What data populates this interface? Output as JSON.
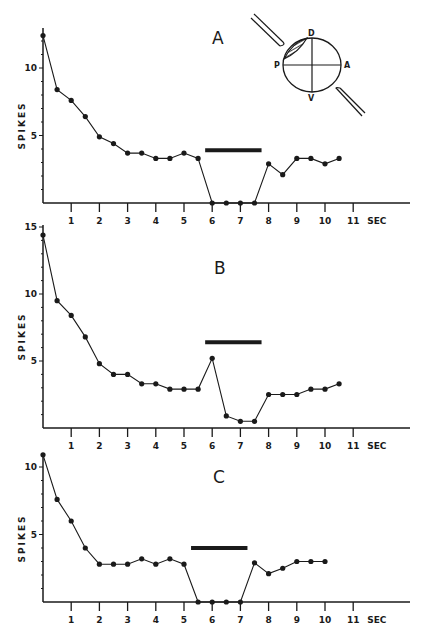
{
  "figure": {
    "x_unit_label": "SEC",
    "y_axis_label": "SPIKES",
    "diagram": {
      "labels": {
        "dorsal": "D",
        "ventral": "V",
        "posterior": "P",
        "anterior": "A"
      }
    }
  },
  "chart_data": [
    {
      "type": "line",
      "panel": "A",
      "title": "A",
      "xlabel": "SEC",
      "ylabel": "SPIKES",
      "xlim": [
        0,
        11
      ],
      "ylim": [
        0,
        12.5
      ],
      "x_ticks": [
        1,
        2,
        3,
        4,
        5,
        6,
        7,
        8,
        9,
        10,
        11
      ],
      "y_ticks": [
        5,
        10
      ],
      "grid": false,
      "stimulus_bar": {
        "start": 5.75,
        "end": 7.75,
        "y": 3.9
      },
      "x": [
        0,
        0.5,
        1,
        1.5,
        2,
        2.5,
        3,
        3.5,
        4,
        4.5,
        5,
        5.5,
        6,
        6.5,
        7,
        7.5,
        8,
        8.5,
        9,
        9.5,
        10,
        10.5
      ],
      "values": [
        12.4,
        8.4,
        7.6,
        6.4,
        4.9,
        4.4,
        3.7,
        3.7,
        3.3,
        3.3,
        3.7,
        3.3,
        0,
        0,
        0,
        0,
        2.9,
        2.1,
        3.3,
        3.3,
        2.9,
        3.3
      ]
    },
    {
      "type": "line",
      "panel": "B",
      "title": "B",
      "xlabel": "SEC",
      "ylabel": "SPIKES",
      "xlim": [
        0,
        11
      ],
      "ylim": [
        0,
        15
      ],
      "x_ticks": [
        1,
        2,
        3,
        4,
        5,
        6,
        7,
        8,
        9,
        10,
        11
      ],
      "y_ticks": [
        5,
        10,
        15
      ],
      "grid": false,
      "stimulus_bar": {
        "start": 5.75,
        "end": 7.75,
        "y": 6.4
      },
      "x": [
        0,
        0.5,
        1,
        1.5,
        2,
        2.5,
        3,
        3.5,
        4,
        4.5,
        5,
        5.5,
        6,
        6.5,
        7,
        7.5,
        8,
        8.5,
        9,
        9.5,
        10,
        10.5
      ],
      "values": [
        14.4,
        9.5,
        8.4,
        6.8,
        4.8,
        4.0,
        4.0,
        3.3,
        3.3,
        2.9,
        2.9,
        2.9,
        5.2,
        0.9,
        0.5,
        0.5,
        2.5,
        2.5,
        2.5,
        2.9,
        2.9,
        3.3
      ]
    },
    {
      "type": "line",
      "panel": "C",
      "title": "C",
      "xlabel": "SEC",
      "ylabel": "SPIKES",
      "xlim": [
        0,
        11
      ],
      "ylim": [
        0,
        11
      ],
      "x_ticks": [
        1,
        2,
        3,
        4,
        5,
        6,
        7,
        8,
        9,
        10,
        11
      ],
      "y_ticks": [
        5,
        10
      ],
      "grid": false,
      "stimulus_bar": {
        "start": 5.25,
        "end": 7.25,
        "y": 4.0
      },
      "x": [
        0,
        0.5,
        1,
        1.5,
        2,
        2.5,
        3,
        3.5,
        4,
        4.5,
        5,
        5.5,
        6,
        6.5,
        7,
        7.5,
        8,
        8.5,
        9,
        9.5,
        10
      ],
      "values": [
        10.9,
        7.6,
        6.0,
        4.0,
        2.8,
        2.8,
        2.8,
        3.2,
        2.8,
        3.2,
        2.8,
        0,
        0,
        0,
        0,
        2.9,
        2.1,
        2.5,
        3.0,
        3.0,
        3.0
      ]
    }
  ]
}
